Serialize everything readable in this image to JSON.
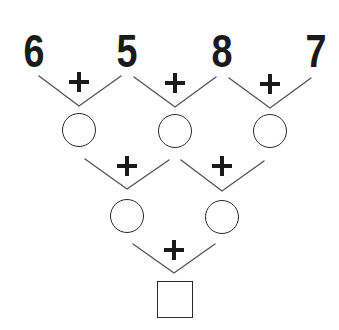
{
  "puzzle": {
    "type": "addition-pyramid",
    "operator": "+",
    "top_numbers": [
      "6",
      "5",
      "8",
      "7"
    ],
    "row1_circles": [
      "",
      "",
      ""
    ],
    "row2_circles": [
      "",
      ""
    ],
    "answer_box": ""
  },
  "colors": {
    "ink": "#1a1a1a",
    "line": "#555555",
    "background": "#ffffff"
  }
}
